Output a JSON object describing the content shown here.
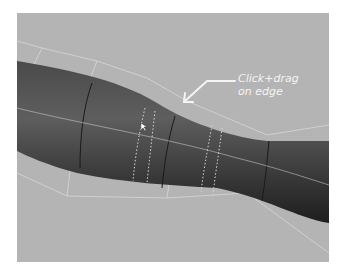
{
  "viewport": {
    "background": "#b4b4b4",
    "mesh_color": "#3a3a3a",
    "cage_color": "#e2e2e2",
    "annotation": {
      "line1": "Click+drag",
      "line2": "on edge"
    }
  }
}
